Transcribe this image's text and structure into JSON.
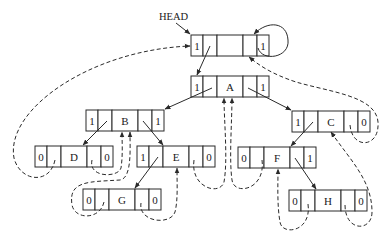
{
  "head_label": "HEAD",
  "colors": {
    "stroke": "#2a2a2a",
    "text": "#1a1a1a",
    "background": "#ffffff"
  },
  "node_layout": {
    "width": 78,
    "height": 21,
    "cell_widths": [
      12,
      14,
      26,
      14,
      12
    ]
  },
  "nodes": [
    {
      "id": "head",
      "x": 191,
      "y": 35,
      "ltag": "1",
      "data": "",
      "rtag": "1",
      "hatched": true
    },
    {
      "id": "A",
      "x": 191,
      "y": 76,
      "ltag": "1",
      "data": "A",
      "rtag": "1"
    },
    {
      "id": "B",
      "x": 86,
      "y": 110,
      "ltag": "1",
      "data": "B",
      "rtag": "1"
    },
    {
      "id": "C",
      "x": 292,
      "y": 111,
      "ltag": "1",
      "data": "C",
      "rtag": "0"
    },
    {
      "id": "D",
      "x": 35,
      "y": 146,
      "ltag": "0",
      "data": "D",
      "rtag": "0"
    },
    {
      "id": "E",
      "x": 137,
      "y": 146,
      "ltag": "1",
      "data": "E",
      "rtag": "0"
    },
    {
      "id": "F",
      "x": 238,
      "y": 147,
      "ltag": "0",
      "data": "F",
      "rtag": "1"
    },
    {
      "id": "G",
      "x": 83,
      "y": 189,
      "ltag": "0",
      "data": "G",
      "rtag": "0"
    },
    {
      "id": "H",
      "x": 289,
      "y": 190,
      "ltag": "0",
      "data": "H",
      "rtag": "0"
    }
  ],
  "tree_edges": [
    {
      "from": "head.lchild",
      "to": "A"
    },
    {
      "from": "head.rchild",
      "to": "head",
      "type": "self-loop"
    },
    {
      "from": "A.lchild",
      "to": "B"
    },
    {
      "from": "A.rchild",
      "to": "C"
    },
    {
      "from": "B.lchild",
      "to": "D"
    },
    {
      "from": "B.rchild",
      "to": "E"
    },
    {
      "from": "C.lchild",
      "to": "F"
    },
    {
      "from": "E.lchild",
      "to": "G"
    },
    {
      "from": "F.rchild",
      "to": "H"
    }
  ],
  "threads": [
    {
      "from": "D.lchild",
      "to": "head",
      "kind": "predecessor"
    },
    {
      "from": "D.rchild",
      "to": "B",
      "kind": "successor"
    },
    {
      "from": "G.lchild",
      "to": "B",
      "kind": "predecessor"
    },
    {
      "from": "G.rchild",
      "to": "E",
      "kind": "successor"
    },
    {
      "from": "E.rchild",
      "to": "A",
      "kind": "successor"
    },
    {
      "from": "F.lchild",
      "to": "A",
      "kind": "predecessor"
    },
    {
      "from": "H.lchild",
      "to": "F",
      "kind": "predecessor"
    },
    {
      "from": "H.rchild",
      "to": "C",
      "kind": "successor"
    },
    {
      "from": "C.rchild",
      "to": "head",
      "kind": "successor"
    }
  ]
}
